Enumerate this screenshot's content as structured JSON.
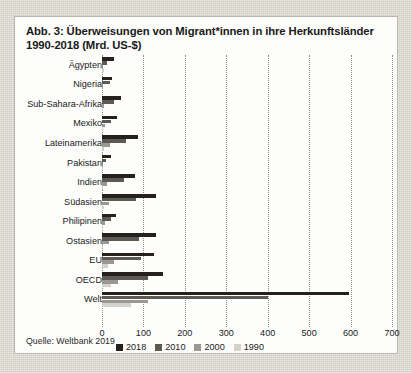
{
  "figure": {
    "title": "Abb. 3: Überweisungen von Migrant*innen in ihre Herkunftsländer 1990-2018 (Mrd. US-$)",
    "source": "Quelle: Weltbank 2019"
  },
  "chart_data": {
    "type": "bar",
    "orientation": "horizontal",
    "title": "Abb. 3: Überweisungen von Migrant*innen in ihre Herkunftsländer 1990-2018 (Mrd. US-$)",
    "xlabel": "",
    "ylabel": "",
    "xlim": [
      0,
      700
    ],
    "xticks": [
      0,
      100,
      200,
      300,
      400,
      500,
      600,
      700
    ],
    "grid": true,
    "legend_position": "bottom",
    "categories": [
      "Ägypten",
      "Nigeria",
      "Sub-Sahara-Afrika",
      "Mexiko",
      "Lateinamerika",
      "Pakistan",
      "Indien",
      "Südasien",
      "Philipinen",
      "Ostasien",
      "EU",
      "OECD",
      "Welt"
    ],
    "series": [
      {
        "name": "2018",
        "color": "#26211d",
        "values": [
          28.9,
          24.3,
          46.0,
          35.7,
          88.0,
          21.0,
          78.6,
          131.0,
          33.8,
          130.0,
          125.0,
          148.0,
          596.0
        ]
      },
      {
        "name": "2010",
        "color": "#5d5953",
        "values": [
          12.5,
          19.7,
          30.0,
          22.1,
          57.0,
          9.7,
          53.5,
          82.0,
          21.6,
          89.0,
          94.0,
          112.0,
          400.0
        ]
      },
      {
        "name": "2000",
        "color": "#9b9791",
        "values": [
          2.9,
          1.4,
          4.6,
          7.5,
          20.0,
          1.1,
          12.9,
          17.0,
          6.2,
          17.0,
          28.0,
          38.0,
          110.0
        ]
      },
      {
        "name": "1990",
        "color": "#d5d2cb",
        "values": [
          4.3,
          0.0,
          1.8,
          3.1,
          5.8,
          2.0,
          2.4,
          5.6,
          1.5,
          3.4,
          15.0,
          22.0,
          70.0
        ]
      }
    ]
  },
  "legend": {
    "items": [
      {
        "label": "2018",
        "color": "#26211d"
      },
      {
        "label": "2010",
        "color": "#5d5953"
      },
      {
        "label": "2000",
        "color": "#9b9791"
      },
      {
        "label": "1990",
        "color": "#d5d2cb"
      }
    ]
  }
}
